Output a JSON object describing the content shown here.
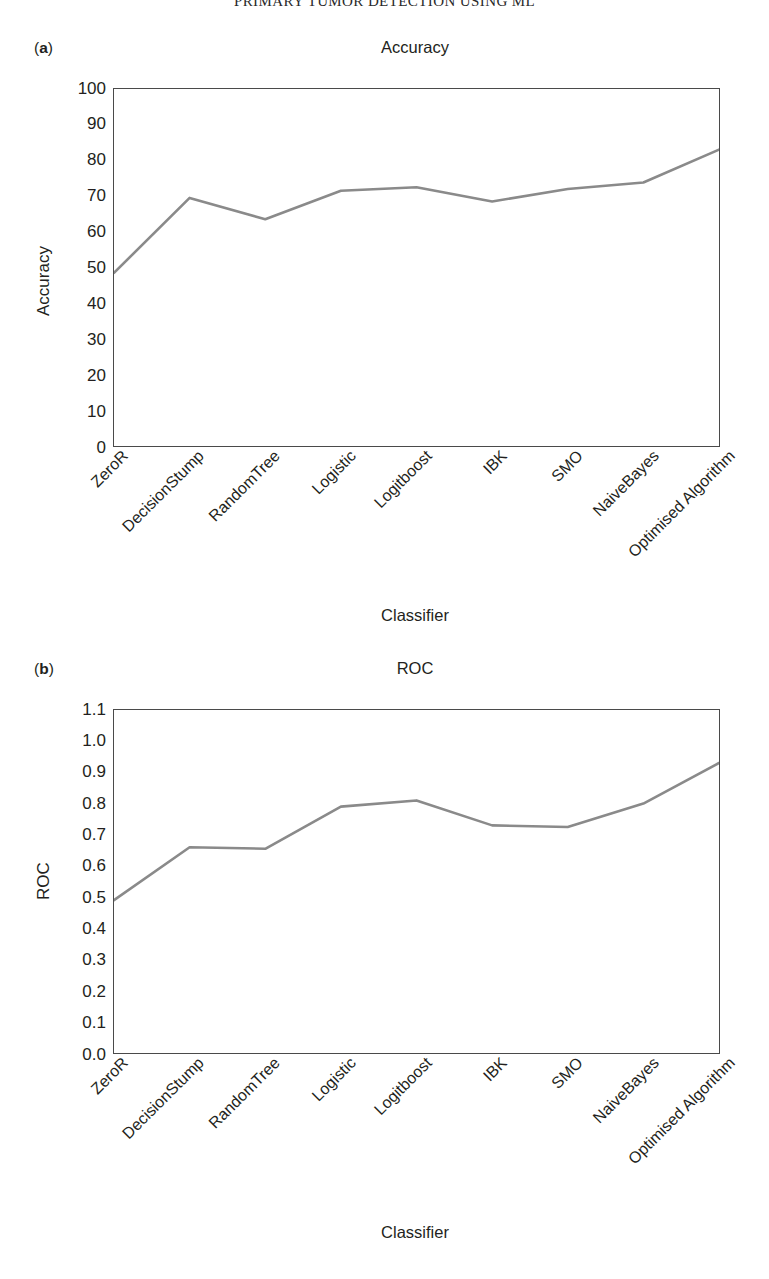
{
  "running_head": "PRIMARY TUMOR DETECTION USING ML",
  "figures": [
    {
      "panel_letter": "a",
      "panel_letter_open": "(",
      "panel_letter_close": ")"
    },
    {
      "panel_letter": "b",
      "panel_letter_open": "(",
      "panel_letter_close": ")"
    }
  ],
  "chart_data": [
    {
      "type": "line",
      "title": "Accuracy",
      "xlabel": "Classifier",
      "ylabel": "Accuracy",
      "categories": [
        "ZeroR",
        "DecisionStump",
        "RandomTree",
        "Logistic",
        "Logitboost",
        "IBK",
        "SMO",
        "NaiveBayes",
        "Optimised Algorithm"
      ],
      "values": [
        48.5,
        69.5,
        63.5,
        71.5,
        72.5,
        68.5,
        72.0,
        73.8,
        83.0
      ],
      "ylim": [
        0,
        100
      ],
      "yticks": [
        0,
        10,
        20,
        30,
        40,
        50,
        60,
        70,
        80,
        90,
        100
      ],
      "ytick_labels": [
        "0",
        "10",
        "20",
        "30",
        "40",
        "50",
        "60",
        "70",
        "80",
        "90",
        "100"
      ],
      "grid": false,
      "legend": "none",
      "line_color": "#8a8a8a"
    },
    {
      "type": "line",
      "title": "ROC",
      "xlabel": "Classifier",
      "ylabel": "ROC",
      "categories": [
        "ZeroR",
        "DecisionStump",
        "RandomTree",
        "Logistic",
        "Logitboost",
        "IBK",
        "SMO",
        "NaiveBayes",
        "Optimised Algorithm"
      ],
      "values": [
        0.49,
        0.66,
        0.655,
        0.79,
        0.81,
        0.73,
        0.725,
        0.8,
        0.93
      ],
      "ylim": [
        0.0,
        1.1
      ],
      "yticks": [
        0.0,
        0.1,
        0.2,
        0.3,
        0.4,
        0.5,
        0.6,
        0.7,
        0.8,
        0.9,
        1.0,
        1.1
      ],
      "ytick_labels": [
        "0.0",
        "0.1",
        "0.2",
        "0.3",
        "0.4",
        "0.5",
        "0.6",
        "0.7",
        "0.8",
        "0.9",
        "1.0",
        "1.1"
      ],
      "grid": false,
      "legend": "none",
      "line_color": "#8a8a8a"
    }
  ]
}
